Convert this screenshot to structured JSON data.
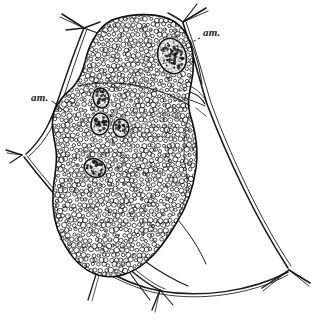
{
  "figure": {
    "title": "am.",
    "kind": "scientific-line-illustration",
    "background_color": "#ffffff",
    "ink_color": "#111111",
    "labels": [
      {
        "id": "am-right",
        "text": "am.",
        "meaning": "amoebocyte",
        "x": 203,
        "y": 27,
        "leader": {
          "from_x": 200,
          "from_y": 38,
          "to_x": 172,
          "to_y": 52,
          "style": "dashed"
        }
      },
      {
        "id": "am-left",
        "text": "am.",
        "meaning": "amoebocyte",
        "x": 31,
        "y": 92,
        "leader": {
          "from_x": 52,
          "from_y": 101,
          "to_x": 66,
          "to_y": 112,
          "style": "solid"
        }
      }
    ],
    "body": {
      "name": "granular-body",
      "outline_color": "#111111",
      "fill_color": "#ffffff",
      "granule_count": 1650,
      "granule_color": "#141414",
      "inclusions": [
        {
          "cx": 172,
          "cy": 56,
          "rx": 14,
          "ry": 18,
          "rot": -18
        },
        {
          "cx": 101,
          "cy": 98,
          "rx": 8,
          "ry": 10,
          "rot": -12
        },
        {
          "cx": 100,
          "cy": 124,
          "rx": 9,
          "ry": 11,
          "rot": 10
        },
        {
          "cx": 121,
          "cy": 128,
          "rx": 8,
          "ry": 9,
          "rot": -5
        },
        {
          "cx": 95,
          "cy": 168,
          "rx": 11,
          "ry": 9,
          "rot": 25
        }
      ]
    },
    "filaments": {
      "name": "spicule-network",
      "stroke_color": "#1a1a1a",
      "junctions": [
        {
          "id": "top-left-node",
          "x": 84,
          "y": 28
        },
        {
          "id": "top-right-node",
          "x": 183,
          "y": 22
        },
        {
          "id": "mid-right-node",
          "x": 205,
          "y": 104
        },
        {
          "id": "left-node",
          "x": 22,
          "y": 155
        },
        {
          "id": "bottom-mid-node",
          "x": 160,
          "y": 290
        },
        {
          "id": "bottom-right-node",
          "x": 289,
          "y": 270
        }
      ]
    }
  }
}
